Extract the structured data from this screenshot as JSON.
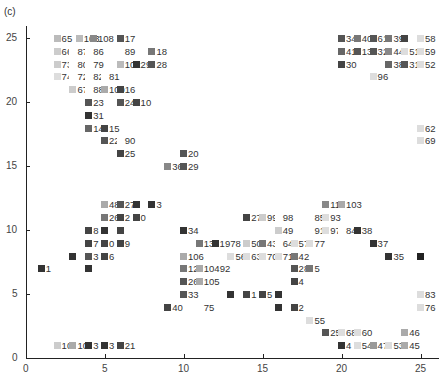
{
  "panel_label": "(c)",
  "chart_data": {
    "type": "scatter",
    "title": "",
    "xlabel": "",
    "ylabel": "",
    "xlim": [
      0,
      26
    ],
    "ylim": [
      0,
      26
    ],
    "xticks": [
      0,
      5,
      10,
      15,
      20,
      25
    ],
    "yticks": [
      0,
      5,
      10,
      15,
      20,
      25
    ],
    "grid": false,
    "legend": null,
    "note": "Labeled square markers on an integer grid; marker shade varies from light gray to black. Labels are node indices.",
    "points": [
      {
        "x": 2,
        "y": 25,
        "label": "65",
        "shade": "#bbb"
      },
      {
        "x": 3.4,
        "y": 25,
        "label": "103",
        "shade": "#bbb"
      },
      {
        "x": 4.3,
        "y": 25,
        "label": "108",
        "shade": "#888"
      },
      {
        "x": 6,
        "y": 25,
        "label": "17",
        "shade": "#555"
      },
      {
        "x": 2,
        "y": 24,
        "label": "66",
        "shade": "#ccc"
      },
      {
        "x": 3,
        "y": 24,
        "label": "87",
        "shade": "#fff"
      },
      {
        "x": 4,
        "y": 24,
        "label": "86",
        "shade": "#fff"
      },
      {
        "x": 6,
        "y": 24,
        "label": "89",
        "shade": "#fff"
      },
      {
        "x": 8,
        "y": 24,
        "label": "18",
        "shade": "#777"
      },
      {
        "x": 2,
        "y": 23,
        "label": "73",
        "shade": "#ccc"
      },
      {
        "x": 3,
        "y": 23,
        "label": "80",
        "shade": "#fff"
      },
      {
        "x": 4,
        "y": 23,
        "label": "79",
        "shade": "#fff"
      },
      {
        "x": 6,
        "y": 23,
        "label": "102",
        "shade": "#bbb"
      },
      {
        "x": 7,
        "y": 23,
        "label": "29",
        "shade": "#333"
      },
      {
        "x": 8,
        "y": 23,
        "label": "28",
        "shade": "#555"
      },
      {
        "x": 2,
        "y": 22,
        "label": "74",
        "shade": "#ddd"
      },
      {
        "x": 3,
        "y": 22,
        "label": "72",
        "shade": "#fff"
      },
      {
        "x": 4,
        "y": 22,
        "label": "82",
        "shade": "#fff"
      },
      {
        "x": 5,
        "y": 22,
        "label": "81",
        "shade": "#fff"
      },
      {
        "x": 3,
        "y": 21,
        "label": "67",
        "shade": "#ccc"
      },
      {
        "x": 4,
        "y": 21,
        "label": "88",
        "shade": "#fff"
      },
      {
        "x": 5,
        "y": 21,
        "label": "109",
        "shade": "#aaa"
      },
      {
        "x": 6,
        "y": 21,
        "label": "16",
        "shade": "#444"
      },
      {
        "x": 4,
        "y": 20,
        "label": "23",
        "shade": "#555"
      },
      {
        "x": 6,
        "y": 20,
        "label": "24",
        "shade": "#555"
      },
      {
        "x": 7,
        "y": 20,
        "label": "10",
        "shade": "#444"
      },
      {
        "x": 4,
        "y": 19,
        "label": "31",
        "shade": "#333"
      },
      {
        "x": 4,
        "y": 18,
        "label": "14",
        "shade": "#666"
      },
      {
        "x": 5,
        "y": 18,
        "label": "15",
        "shade": "#444"
      },
      {
        "x": 5,
        "y": 17,
        "label": "22",
        "shade": "#555"
      },
      {
        "x": 6,
        "y": 17,
        "label": "90",
        "shade": "#fff"
      },
      {
        "x": 6,
        "y": 16,
        "label": "25",
        "shade": "#444"
      },
      {
        "x": 10,
        "y": 16,
        "label": "20",
        "shade": "#555"
      },
      {
        "x": 9,
        "y": 15,
        "label": "36",
        "shade": "#888"
      },
      {
        "x": 10,
        "y": 15,
        "label": "29",
        "shade": "#555"
      },
      {
        "x": 20,
        "y": 25,
        "label": "",
        "shade": "#ccc"
      },
      {
        "x": 20,
        "y": 25,
        "label": "34",
        "shade": "#555"
      },
      {
        "x": 21,
        "y": 25,
        "label": "40",
        "shade": "#777"
      },
      {
        "x": 22,
        "y": 25,
        "label": "61",
        "shade": "#555"
      },
      {
        "x": 23,
        "y": 25,
        "label": "39",
        "shade": "#777"
      },
      {
        "x": 24,
        "y": 25,
        "label": "",
        "shade": "#444"
      },
      {
        "x": 25,
        "y": 25,
        "label": "58",
        "shade": "#ddd"
      },
      {
        "x": 20,
        "y": 24,
        "label": "41",
        "shade": "#666"
      },
      {
        "x": 21,
        "y": 24,
        "label": "13",
        "shade": "#555"
      },
      {
        "x": 22,
        "y": 24,
        "label": "32",
        "shade": "#555"
      },
      {
        "x": 23,
        "y": 24,
        "label": "44",
        "shade": "#888"
      },
      {
        "x": 24,
        "y": 24,
        "label": "51",
        "shade": "#ddd"
      },
      {
        "x": 25,
        "y": 24,
        "label": "59",
        "shade": "#ddd"
      },
      {
        "x": 20,
        "y": 23,
        "label": "30",
        "shade": "#444"
      },
      {
        "x": 23,
        "y": 23,
        "label": "38",
        "shade": "#666"
      },
      {
        "x": 24,
        "y": 23,
        "label": "31",
        "shade": "#555"
      },
      {
        "x": 25,
        "y": 23,
        "label": "52",
        "shade": "#ddd"
      },
      {
        "x": 22,
        "y": 22,
        "label": "96",
        "shade": "#ddd"
      },
      {
        "x": 25,
        "y": 18,
        "label": "62",
        "shade": "#ddd"
      },
      {
        "x": 25,
        "y": 17,
        "label": "69",
        "shade": "#ddd"
      },
      {
        "x": 5,
        "y": 12,
        "label": "48",
        "shade": "#aaa"
      },
      {
        "x": 6,
        "y": 12,
        "label": "27",
        "shade": "#555"
      },
      {
        "x": 7,
        "y": 12,
        "label": "",
        "shade": "#333"
      },
      {
        "x": 8,
        "y": 12,
        "label": "3",
        "shade": "#333"
      },
      {
        "x": 5,
        "y": 11,
        "label": "26",
        "shade": "#777"
      },
      {
        "x": 6,
        "y": 11,
        "label": "2",
        "shade": "#444"
      },
      {
        "x": 7,
        "y": 11,
        "label": "0",
        "shade": "#444"
      },
      {
        "x": 4,
        "y": 10,
        "label": "8",
        "shade": "#444"
      },
      {
        "x": 5,
        "y": 10,
        "label": "",
        "shade": "#333"
      },
      {
        "x": 6,
        "y": 10,
        "label": "",
        "shade": "#444"
      },
      {
        "x": 4,
        "y": 9,
        "label": "7",
        "shade": "#444"
      },
      {
        "x": 5,
        "y": 9,
        "label": "0",
        "shade": "#444"
      },
      {
        "x": 6,
        "y": 9,
        "label": "9",
        "shade": "#444"
      },
      {
        "x": 3,
        "y": 8,
        "label": "",
        "shade": "#333"
      },
      {
        "x": 4,
        "y": 8,
        "label": "3",
        "shade": "#555"
      },
      {
        "x": 5,
        "y": 8,
        "label": "6",
        "shade": "#444"
      },
      {
        "x": 1,
        "y": 7,
        "label": "1",
        "shade": "#333"
      },
      {
        "x": 4,
        "y": 7,
        "label": "",
        "shade": "#333"
      },
      {
        "x": 10,
        "y": 10,
        "label": "34",
        "shade": "#333"
      },
      {
        "x": 11,
        "y": 9,
        "label": "13",
        "shade": "#777"
      },
      {
        "x": 12,
        "y": 9,
        "label": "1978",
        "shade": "#333"
      },
      {
        "x": 14,
        "y": 9,
        "label": "50",
        "shade": "#ccc"
      },
      {
        "x": 15,
        "y": 9,
        "label": "43",
        "shade": "#777"
      },
      {
        "x": 16,
        "y": 9,
        "label": "64",
        "shade": "#fff"
      },
      {
        "x": 17,
        "y": 9,
        "label": "57",
        "shade": "#ddd"
      },
      {
        "x": 18,
        "y": 9,
        "label": "77",
        "shade": "#ddd"
      },
      {
        "x": 10,
        "y": 8,
        "label": "106",
        "shade": "#aaa"
      },
      {
        "x": 13,
        "y": 8,
        "label": "56",
        "shade": "#ddd"
      },
      {
        "x": 14,
        "y": 8,
        "label": "63",
        "shade": "#ddd"
      },
      {
        "x": 15,
        "y": 8,
        "label": "70",
        "shade": "#ddd"
      },
      {
        "x": 16,
        "y": 8,
        "label": "71",
        "shade": "#ddd"
      },
      {
        "x": 17,
        "y": 8,
        "label": "42",
        "shade": "#777"
      },
      {
        "x": 10,
        "y": 7,
        "label": "12",
        "shade": "#777"
      },
      {
        "x": 11,
        "y": 7,
        "label": "10492",
        "shade": "#aaa"
      },
      {
        "x": 17,
        "y": 7,
        "label": "28",
        "shade": "#555"
      },
      {
        "x": 18,
        "y": 7,
        "label": "5",
        "shade": "#777"
      },
      {
        "x": 10,
        "y": 6,
        "label": "26",
        "shade": "#555"
      },
      {
        "x": 11,
        "y": 6,
        "label": "105",
        "shade": "#aaa"
      },
      {
        "x": 17,
        "y": 6,
        "label": "4",
        "shade": "#444"
      },
      {
        "x": 10,
        "y": 5,
        "label": "33",
        "shade": "#555"
      },
      {
        "x": 13,
        "y": 5,
        "label": "",
        "shade": "#333"
      },
      {
        "x": 14,
        "y": 5,
        "label": "1",
        "shade": "#444"
      },
      {
        "x": 15,
        "y": 5,
        "label": "5",
        "shade": "#444"
      },
      {
        "x": 16,
        "y": 5,
        "label": "",
        "shade": "#333"
      },
      {
        "x": 9,
        "y": 4,
        "label": "40",
        "shade": "#444"
      },
      {
        "x": 11,
        "y": 4,
        "label": "75",
        "shade": "#fff"
      },
      {
        "x": 16,
        "y": 4,
        "label": "",
        "shade": "#333"
      },
      {
        "x": 17,
        "y": 4,
        "label": "2",
        "shade": "#444"
      },
      {
        "x": 14,
        "y": 11,
        "label": "27",
        "shade": "#444"
      },
      {
        "x": 15,
        "y": 11,
        "label": "99",
        "shade": "#ccc"
      },
      {
        "x": 16,
        "y": 11,
        "label": "98",
        "shade": "#fff"
      },
      {
        "x": 16,
        "y": 10,
        "label": "49",
        "shade": "#ccc"
      },
      {
        "x": 19,
        "y": 12,
        "label": "11",
        "shade": "#888"
      },
      {
        "x": 20,
        "y": 12,
        "label": "103",
        "shade": "#aaa"
      },
      {
        "x": 18,
        "y": 11,
        "label": "85",
        "shade": "#fff"
      },
      {
        "x": 19,
        "y": 11,
        "label": "93",
        "shade": "#ddd"
      },
      {
        "x": 18,
        "y": 10,
        "label": "91",
        "shade": "#fff"
      },
      {
        "x": 19,
        "y": 10,
        "label": "97",
        "shade": "#ddd"
      },
      {
        "x": 20,
        "y": 10,
        "label": "84",
        "shade": "#fff"
      },
      {
        "x": 21,
        "y": 10,
        "label": "38",
        "shade": "#333"
      },
      {
        "x": 22,
        "y": 9,
        "label": "37",
        "shade": "#333"
      },
      {
        "x": 23,
        "y": 8,
        "label": "35",
        "shade": "#333"
      },
      {
        "x": 25,
        "y": 8,
        "label": "",
        "shade": "#222"
      },
      {
        "x": 18,
        "y": 3,
        "label": "55",
        "shade": "#ddd"
      },
      {
        "x": 25,
        "y": 5,
        "label": "83",
        "shade": "#ddd"
      },
      {
        "x": 25,
        "y": 4,
        "label": "76",
        "shade": "#ddd"
      },
      {
        "x": 19,
        "y": 2,
        "label": "25",
        "shade": "#555"
      },
      {
        "x": 20,
        "y": 2,
        "label": "68",
        "shade": "#ddd"
      },
      {
        "x": 21,
        "y": 2,
        "label": "60",
        "shade": "#ddd"
      },
      {
        "x": 24,
        "y": 2,
        "label": "46",
        "shade": "#aaa"
      },
      {
        "x": 20,
        "y": 1,
        "label": "4",
        "shade": "#333"
      },
      {
        "x": 21,
        "y": 1,
        "label": "54",
        "shade": "#ddd"
      },
      {
        "x": 22,
        "y": 1,
        "label": "47",
        "shade": "#999"
      },
      {
        "x": 23,
        "y": 1,
        "label": "53",
        "shade": "#ddd"
      },
      {
        "x": 24,
        "y": 1,
        "label": "45",
        "shade": "#aaa"
      },
      {
        "x": 2,
        "y": 1,
        "label": "10",
        "shade": "#ccc"
      },
      {
        "x": 3,
        "y": 1,
        "label": "10",
        "shade": "#aaa"
      },
      {
        "x": 4,
        "y": 1,
        "label": "3",
        "shade": "#333"
      },
      {
        "x": 5,
        "y": 1,
        "label": "3",
        "shade": "#333"
      },
      {
        "x": 6,
        "y": 1,
        "label": "21",
        "shade": "#444"
      }
    ]
  }
}
